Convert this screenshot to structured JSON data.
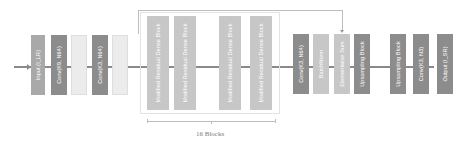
{
  "diagram": {
    "blocks": [
      {
        "id": "input",
        "label": "Input (I_LR)"
      },
      {
        "id": "conv1",
        "label": "Conv(K9, N64)"
      },
      {
        "id": "pale1",
        "label": ""
      },
      {
        "id": "conv2",
        "label": "Conv(K3, N64)"
      },
      {
        "id": "pale2",
        "label": ""
      },
      {
        "id": "mrdb1",
        "label": "Modified Residual Dense Block"
      },
      {
        "id": "mrdb2",
        "label": "Modified Residual Dense Block"
      },
      {
        "id": "mrdb3",
        "label": "Modified Residual Dense Block"
      },
      {
        "id": "mrdb4",
        "label": "Modified Residual Dense Block"
      },
      {
        "id": "conv3",
        "label": "Conv(K3, N64)"
      },
      {
        "id": "batchnorm",
        "label": "BatchNorm"
      },
      {
        "id": "elemsum",
        "label": "Elementwise Sum"
      },
      {
        "id": "up1",
        "label": "Upsampling Block"
      },
      {
        "id": "up2",
        "label": "Upsampling Block"
      },
      {
        "id": "conv4",
        "label": "Conv(K3, N3)"
      },
      {
        "id": "output",
        "label": "Output (I_SR)"
      }
    ],
    "group_caption": "16 Blocks"
  }
}
